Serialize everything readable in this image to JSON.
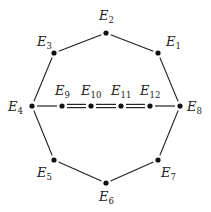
{
  "diagram": {
    "type": "graph",
    "nodes": [
      {
        "id": "E1",
        "base": "E",
        "sub": "1",
        "x": 158,
        "y": 53,
        "lx": 166,
        "ly": 46
      },
      {
        "id": "E2",
        "base": "E",
        "sub": "2",
        "x": 106,
        "y": 33,
        "lx": 99,
        "ly": 20
      },
      {
        "id": "E3",
        "base": "E",
        "sub": "3",
        "x": 54,
        "y": 53,
        "lx": 37,
        "ly": 46
      },
      {
        "id": "E4",
        "base": "E",
        "sub": "4",
        "x": 32,
        "y": 106,
        "lx": 8,
        "ly": 111
      },
      {
        "id": "E5",
        "base": "E",
        "sub": "5",
        "x": 54,
        "y": 160,
        "lx": 37,
        "ly": 177
      },
      {
        "id": "E6",
        "base": "E",
        "sub": "6",
        "x": 106,
        "y": 183,
        "lx": 99,
        "ly": 201
      },
      {
        "id": "E7",
        "base": "E",
        "sub": "7",
        "x": 158,
        "y": 160,
        "lx": 161,
        "ly": 177
      },
      {
        "id": "E8",
        "base": "E",
        "sub": "8",
        "x": 180,
        "y": 106,
        "lx": 187,
        "ly": 111
      },
      {
        "id": "E9",
        "base": "E",
        "sub": "9",
        "x": 62,
        "y": 106,
        "lx": 55,
        "ly": 95
      },
      {
        "id": "E10",
        "base": "E",
        "sub": "10",
        "x": 91,
        "y": 106,
        "lx": 81,
        "ly": 95
      },
      {
        "id": "E11",
        "base": "E",
        "sub": "11",
        "x": 121,
        "y": 106,
        "lx": 111,
        "ly": 95
      },
      {
        "id": "E12",
        "base": "E",
        "sub": "12",
        "x": 150,
        "y": 106,
        "lx": 140,
        "ly": 95
      }
    ],
    "edges": [
      {
        "from": "E1",
        "to": "E2",
        "style": "single"
      },
      {
        "from": "E2",
        "to": "E3",
        "style": "single"
      },
      {
        "from": "E3",
        "to": "E4",
        "style": "single"
      },
      {
        "from": "E4",
        "to": "E5",
        "style": "single"
      },
      {
        "from": "E5",
        "to": "E6",
        "style": "single"
      },
      {
        "from": "E6",
        "to": "E7",
        "style": "single"
      },
      {
        "from": "E7",
        "to": "E8",
        "style": "single"
      },
      {
        "from": "E8",
        "to": "E1",
        "style": "single"
      },
      {
        "from": "E4",
        "to": "E9",
        "style": "single"
      },
      {
        "from": "E9",
        "to": "E10",
        "style": "double"
      },
      {
        "from": "E10",
        "to": "E11",
        "style": "double"
      },
      {
        "from": "E11",
        "to": "E12",
        "style": "double"
      },
      {
        "from": "E12",
        "to": "E8",
        "style": "single"
      }
    ]
  }
}
